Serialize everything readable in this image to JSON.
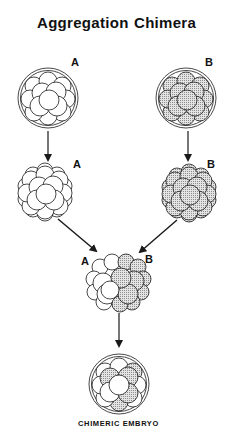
{
  "title": {
    "left": "Aggregation",
    "right": "Chimera"
  },
  "labels": {
    "row1_left": "A",
    "row1_right": "B",
    "row2_left": "A",
    "row2_right": "B",
    "merge_left": "A",
    "merge_right": "B"
  },
  "caption": "CHIMERIC EMBRYO",
  "colors": {
    "line": "#1a1a1a",
    "shade": "#c9c9c9",
    "background": "#ffffff"
  },
  "stages": [
    {
      "id": "embryo-a-zona",
      "label": "A",
      "type": "morula-with-zona",
      "shaded": false
    },
    {
      "id": "embryo-b-zona",
      "label": "B",
      "type": "morula-with-zona",
      "shaded": true
    },
    {
      "id": "embryo-a-denuded",
      "label": "A",
      "type": "denuded-morula",
      "shaded": false
    },
    {
      "id": "embryo-b-denuded",
      "label": "B",
      "type": "denuded-morula",
      "shaded": true
    },
    {
      "id": "aggregate",
      "label": "A + B",
      "type": "aggregated-morulae",
      "shaded": "half"
    },
    {
      "id": "chimeric-embryo",
      "label": "CHIMERIC EMBRYO",
      "type": "chimera-with-zona",
      "shaded": "mixed"
    }
  ]
}
